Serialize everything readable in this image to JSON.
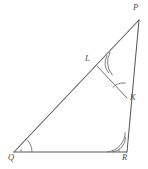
{
  "figure": {
    "kind": "geometry-diagram",
    "background_color": "#ffffff",
    "stroke_color": "#59595b",
    "label_color": "#4a4a4c",
    "canvas": {
      "width": 148,
      "height": 169
    }
  },
  "vertices": [
    {
      "id": "P",
      "label": "P",
      "x": 139,
      "y": 20,
      "label_x": 133,
      "label_y": 4,
      "on": "apex"
    },
    {
      "id": "Q",
      "label": "Q",
      "x": 14,
      "y": 152,
      "label_x": 9,
      "label_y": 154,
      "on": "base-left"
    },
    {
      "id": "R",
      "label": "R",
      "x": 127,
      "y": 152,
      "label_x": 123,
      "label_y": 154,
      "on": "base-right"
    },
    {
      "id": "K",
      "label": "K",
      "x": 127,
      "y": 98,
      "label_x": 130,
      "label_y": 95,
      "on": "segment-PR"
    },
    {
      "id": "L",
      "label": "L",
      "x": 97,
      "y": 66,
      "label_x": 86,
      "label_y": 56,
      "on": "segment-QP"
    }
  ],
  "segments": [
    {
      "id": "QP",
      "from": "Q",
      "to": "P",
      "kind": "triangle-side"
    },
    {
      "id": "PR",
      "from": "P",
      "to": "R",
      "kind": "triangle-side"
    },
    {
      "id": "QR",
      "from": "Q",
      "to": "R",
      "kind": "triangle-side"
    },
    {
      "id": "LK",
      "from": "L",
      "to": "K",
      "kind": "cevian"
    }
  ],
  "angle_marks": [
    {
      "at": "Q",
      "arcs": 1,
      "note": "single arc at Q"
    },
    {
      "at": "R",
      "arcs": 2,
      "note": "double arc at R between RQ and RP"
    },
    {
      "at": "L",
      "arcs": 2,
      "note": "double arc at L between LP and LK"
    },
    {
      "at": "K",
      "arcs": 1,
      "note": "single arc at K between KP and KL"
    }
  ]
}
